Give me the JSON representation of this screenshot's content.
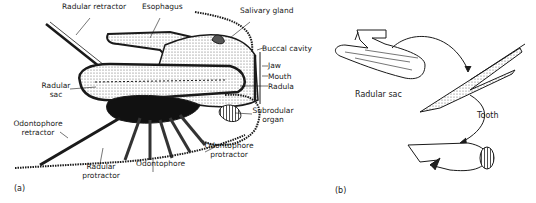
{
  "panel_a": {
    "caption": "(a)",
    "labels": {
      "radular_retractor": "Radular retractor",
      "esophagus": "Esophagus",
      "salivary_gland": "Salivary gland",
      "buccal_cavity": "Buccal cavity",
      "jaw": "Jaw",
      "mouth": "Mouth",
      "radula": "Radula",
      "radular_sac_1": "Radular",
      "radular_sac_2": "sac",
      "subradular_organ_1": "Subrodular",
      "subradular_organ_2": "organ",
      "odontophore_retractor_1": "Odontophore",
      "odontophore_retractor_2": "retractor",
      "odontophore_protractor_1": "Odontophore",
      "odontophore_protractor_2": "protractor",
      "odontophore": "Odontophore",
      "radular_protractor_1": "Radular",
      "radular_protractor_2": "protractor"
    }
  },
  "panel_b": {
    "caption": "(b)",
    "labels": {
      "radular_sac": "Radular sac",
      "tooth": "Tooth"
    }
  },
  "colors": {
    "ink": "#1a1a1a",
    "fill_dark": "#111111",
    "stipple": "#8a8a8a"
  }
}
